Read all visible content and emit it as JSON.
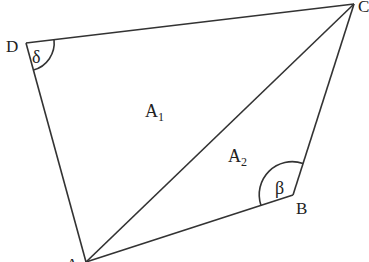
{
  "diagram": {
    "type": "quadrilateral",
    "vertices": {
      "A": "A",
      "B": "B",
      "C": "C",
      "D": "D"
    },
    "edges": [
      "DC",
      "CB",
      "BA",
      "AD",
      "AC"
    ],
    "regions": {
      "A1": {
        "main": "A",
        "sub": "1"
      },
      "A2": {
        "main": "A",
        "sub": "2"
      }
    },
    "angles": {
      "delta": {
        "vertex": "D",
        "symbol": "δ"
      },
      "beta": {
        "vertex": "B",
        "symbol": "β"
      }
    },
    "line_color": "#333333"
  }
}
